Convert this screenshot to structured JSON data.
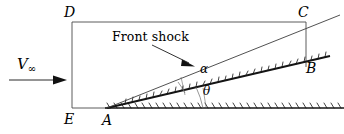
{
  "figure": {
    "title_text": "Front shock",
    "labels": {
      "point_d": "D",
      "point_c": "C",
      "point_b": "B",
      "point_e": "E",
      "point_a": "A",
      "angle_alpha": "α",
      "angle_theta": "θ",
      "velocity_symbol": "V",
      "velocity_subscript": "∞"
    },
    "annotation": {
      "label": "Front shock",
      "leader_from": [
        155,
        46
      ],
      "leader_to": [
        194,
        66
      ]
    },
    "geometry": {
      "control_volume_box": {
        "name": "DCBE-control-volume",
        "top_left": [
          72,
          22
        ],
        "top_right": [
          306,
          22
        ],
        "bottom_left": [
          72,
          108
        ],
        "bottom_right_vertical_to": [
          306,
          68
        ]
      },
      "ground_line": {
        "from": [
          72,
          108
        ],
        "to": [
          344,
          108
        ]
      },
      "wedge_surface": {
        "from": [
          107,
          108
        ],
        "to": [
          312,
          60
        ],
        "angle_label": "θ"
      },
      "shock_line": {
        "from": [
          107,
          108
        ],
        "to": [
          336,
          16
        ],
        "angle_label": "α"
      },
      "freestream_arrow": {
        "from": [
          10,
          80
        ],
        "to": [
          66,
          80
        ]
      },
      "vertical_drop_cb": {
        "from": [
          306,
          22
        ],
        "to": [
          306,
          68
        ]
      }
    },
    "colors": {
      "background": "#ffffff",
      "stroke": "#1a1a1a",
      "thin_stroke": "#555555",
      "text": "#000000"
    },
    "hatching": {
      "ground_tick_count": 34,
      "wedge_tick_count": 30,
      "style": "slanted-ticks"
    }
  }
}
